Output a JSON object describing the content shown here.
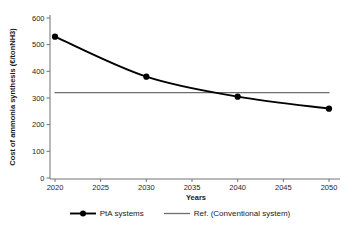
{
  "chart_data": {
    "type": "line",
    "title": "",
    "xlabel": "Years",
    "ylabel": "Cost of ammonia synthesis (€/tonNH3)",
    "xlim": [
      2020,
      2050
    ],
    "ylim": [
      0,
      600
    ],
    "xticks": [
      2020,
      2025,
      2030,
      2035,
      2040,
      2045,
      2050
    ],
    "yticks": [
      0,
      100,
      200,
      300,
      400,
      500,
      600
    ],
    "grid": false,
    "legend_position": "bottom-center",
    "axis_color": "#737373",
    "text_color": "#262626",
    "background": "#ffffff",
    "series": [
      {
        "name": "PtA systems",
        "x": [
          2020,
          2030,
          2040,
          2050
        ],
        "values": [
          530,
          380,
          305,
          260
        ],
        "color": "#000000",
        "marker": "circle",
        "line_style": "smooth",
        "line_width": 1.9
      },
      {
        "name": "Ref. (Conventional system)",
        "x": [
          2020,
          2050
        ],
        "values": [
          320,
          320
        ],
        "color": "#6e6e6e",
        "marker": "none",
        "line_style": "straight",
        "line_width": 1.3
      }
    ]
  }
}
